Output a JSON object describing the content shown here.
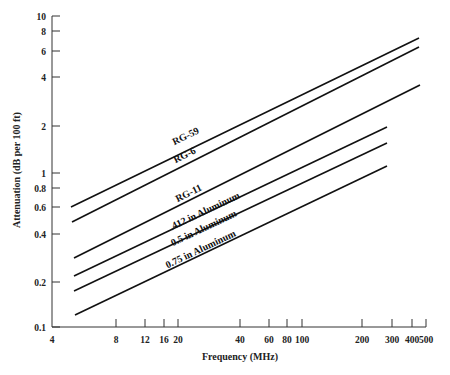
{
  "chart_data": {
    "type": "line",
    "title": "",
    "xlabel": "Frequency (MHz)",
    "ylabel": "Attenuation (dB per 100 ft)",
    "xscale": "log",
    "yscale": "log",
    "xlim": [
      4,
      500
    ],
    "ylim": [
      0.1,
      10
    ],
    "grid": false,
    "legend": "inline labels on lines",
    "x_ticks": [
      {
        "value": 4,
        "label": "4",
        "px": 52
      },
      {
        "value": 8,
        "label": "8",
        "px": 116
      },
      {
        "value": 12,
        "label": "12",
        "px": 145
      },
      {
        "value": 16,
        "label": "16",
        "px": 164
      },
      {
        "value": 20,
        "label": "20",
        "px": 178
      },
      {
        "value": 40,
        "label": "40",
        "px": 240
      },
      {
        "value": 60,
        "label": "60",
        "px": 269
      },
      {
        "value": 80,
        "label": "80",
        "px": 287
      },
      {
        "value": 100,
        "label": "100",
        "px": 302
      },
      {
        "value": 200,
        "label": "200",
        "px": 362
      },
      {
        "value": 300,
        "label": "300",
        "px": 392
      },
      {
        "value": 400,
        "label": "400",
        "px": 412
      },
      {
        "value": 500,
        "label": "500",
        "px": 426
      }
    ],
    "y_ticks": [
      {
        "value": 10,
        "label": "10",
        "px": 16
      },
      {
        "value": 8,
        "label": "8",
        "px": 31
      },
      {
        "value": 6,
        "label": "6",
        "px": 51
      },
      {
        "value": 4,
        "label": "4",
        "px": 77
      },
      {
        "value": 2,
        "label": "2",
        "px": 126
      },
      {
        "value": 1,
        "label": "1",
        "px": 173
      },
      {
        "value": 0.8,
        "label": "0.8",
        "px": 188
      },
      {
        "value": 0.6,
        "label": "0.6",
        "px": 207
      },
      {
        "value": 0.4,
        "label": "0.4",
        "px": 234
      },
      {
        "value": 0.2,
        "label": "0.2",
        "px": 282
      },
      {
        "value": 0.1,
        "label": "0.1",
        "px": 327
      }
    ],
    "series": [
      {
        "name": "RG-59",
        "x": [
          5,
          450
        ],
        "values": [
          0.59,
          7.1
        ],
        "px": [
          [
            71,
            207
          ],
          [
            419,
            38
          ]
        ],
        "label_pos": [
          187,
          139
        ]
      },
      {
        "name": "RG-6",
        "x": [
          5,
          450
        ],
        "values": [
          0.47,
          6.3
        ],
        "px": [
          [
            72,
            222
          ],
          [
            419,
            47
          ]
        ],
        "label_pos": [
          186,
          158
        ]
      },
      {
        "name": "RG-11",
        "x": [
          5,
          450
        ],
        "values": [
          0.27,
          3.6
        ],
        "px": [
          [
            74,
            258
          ],
          [
            420,
            85
          ]
        ],
        "label_pos": [
          190,
          196
        ]
      },
      {
        "name": ".412 in Aluminum",
        "x": [
          5,
          300
        ],
        "values": [
          0.21,
          1.9
        ],
        "px": [
          [
            74,
            276
          ],
          [
            387,
            127
          ]
        ],
        "label_pos": [
          206,
          214
        ]
      },
      {
        "name": "0.5 in Aluminum",
        "x": [
          5,
          300
        ],
        "values": [
          0.17,
          1.5
        ],
        "px": [
          [
            74,
            291
          ],
          [
            387,
            143
          ]
        ],
        "label_pos": [
          205,
          231
        ]
      },
      {
        "name": "0.75 in Aluminum",
        "x": [
          5,
          300
        ],
        "values": [
          0.12,
          1.08
        ],
        "px": [
          [
            75,
            315
          ],
          [
            387,
            166
          ]
        ],
        "label_pos": [
          202,
          252
        ]
      }
    ]
  }
}
